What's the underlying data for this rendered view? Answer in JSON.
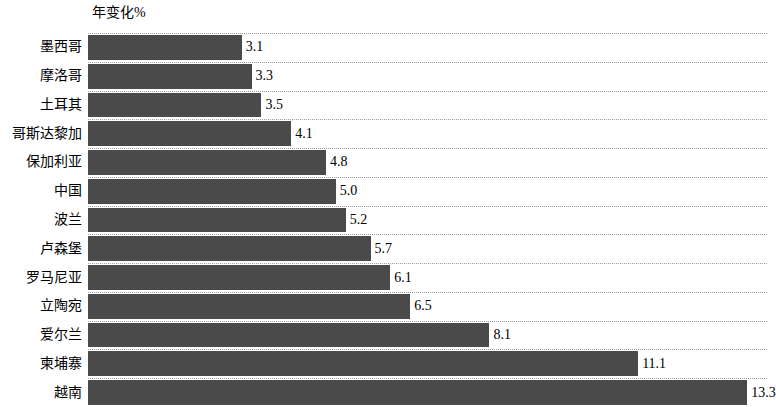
{
  "chart_data": {
    "type": "bar",
    "orientation": "horizontal",
    "title": "",
    "axis_title": "年变化%",
    "xlabel": "",
    "ylabel": "",
    "grid": true,
    "legend": null,
    "xlim": [
      0,
      13.7
    ],
    "categories": [
      "墨西哥",
      "摩洛哥",
      "土耳其",
      "哥斯达黎加",
      "保加利亚",
      "中国",
      "波兰",
      "卢森堡",
      "罗马尼亚",
      "立陶宛",
      "爱尔兰",
      "柬埔寨",
      "越南"
    ],
    "values": [
      3.1,
      3.3,
      3.5,
      4.1,
      4.8,
      5.0,
      5.2,
      5.7,
      6.1,
      6.5,
      8.1,
      11.1,
      13.3
    ],
    "labels": [
      "3.1",
      "3.3",
      "3.5",
      "4.1",
      "4.8",
      "5.0",
      "5.2",
      "5.7",
      "6.1",
      "6.5",
      "8.1",
      "11.1",
      "13.3"
    ],
    "bar_color": "#4a4a4a"
  }
}
